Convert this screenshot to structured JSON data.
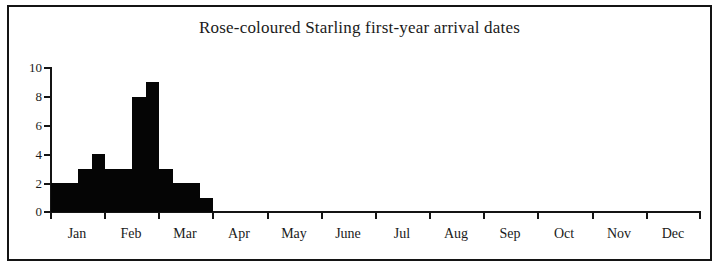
{
  "figure": {
    "title": "Rose-coloured Starling first-year arrival dates",
    "border_color": "#141414",
    "background": "#ffffff",
    "bar_color": "#050505"
  },
  "chart_data": {
    "type": "bar",
    "title": "Rose-coloured Starling first-year arrival dates",
    "xlabel": "",
    "ylabel": "",
    "ylim": [
      0,
      10
    ],
    "yticks": [
      0,
      2,
      4,
      6,
      8,
      10
    ],
    "ytick_labels": [
      "0",
      "2",
      "4",
      "6",
      "8",
      "10"
    ],
    "grid": false,
    "legend": "none",
    "x_axis_type": "months",
    "categories": [
      "Jan",
      "Feb",
      "Mar",
      "Apr",
      "May",
      "June",
      "Jul",
      "Aug",
      "Sep",
      "Oct",
      "Nov",
      "Dec"
    ],
    "bin_note": "bars are sub-monthly (approximately weekly) bins",
    "bins": [
      {
        "label": "late Aug 1",
        "month_position": 8.0,
        "value": 2
      },
      {
        "label": "late Aug 2",
        "month_position": 8.25,
        "value": 2
      },
      {
        "label": "Sep 1",
        "month_position": 8.5,
        "value": 3
      },
      {
        "label": "Sep 2",
        "month_position": 8.75,
        "value": 4
      },
      {
        "label": "Sep 3",
        "month_position": 9.0,
        "value": 3
      },
      {
        "label": "Sep 4",
        "month_position": 9.25,
        "value": 3
      },
      {
        "label": "late Sep",
        "month_position": 9.5,
        "value": 8
      },
      {
        "label": "Oct 1",
        "month_position": 9.75,
        "value": 9
      },
      {
        "label": "Oct 2",
        "month_position": 10.0,
        "value": 3
      },
      {
        "label": "Oct 3",
        "month_position": 10.25,
        "value": 2
      },
      {
        "label": "Oct 4",
        "month_position": 10.5,
        "value": 2
      },
      {
        "label": "early Nov",
        "month_position": 10.75,
        "value": 1
      }
    ],
    "values": [
      2,
      2,
      3,
      4,
      3,
      3,
      8,
      9,
      3,
      2,
      2,
      1
    ],
    "max_value": 9,
    "total_count": 42
  }
}
